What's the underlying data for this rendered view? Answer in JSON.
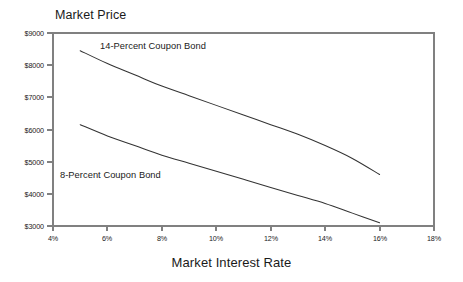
{
  "chart_data": {
    "type": "line",
    "title": "Market Price",
    "xlabel": "Market Interest Rate",
    "ylabel": "Market Price",
    "xlim": [
      4,
      18
    ],
    "ylim": [
      3000,
      9000
    ],
    "grid": false,
    "legend_position": "inline-annotation",
    "x_tick_labels": [
      "4%",
      "6%",
      "8%",
      "10%",
      "12%",
      "14%",
      "16%",
      "18%"
    ],
    "x_tick_values": [
      4,
      6,
      8,
      10,
      12,
      14,
      16,
      18
    ],
    "y_tick_labels": [
      "$9000",
      "$8000",
      "$7000",
      "$6000",
      "$5000",
      "$4000",
      "$3000"
    ],
    "y_tick_values": [
      9000,
      8000,
      7000,
      6000,
      5000,
      4000,
      3000
    ],
    "series": [
      {
        "name": "14-Percent Coupon Bond",
        "x": [
          5,
          6,
          7,
          8,
          9,
          10,
          11,
          12,
          13,
          14,
          15,
          16
        ],
        "values": [
          8450,
          8050,
          7700,
          7350,
          7050,
          6750,
          6450,
          6150,
          5850,
          5500,
          5100,
          4600
        ]
      },
      {
        "name": "8-Percent Coupon Bond",
        "x": [
          5,
          6,
          7,
          8,
          9,
          10,
          11,
          12,
          13,
          14,
          15,
          16
        ],
        "values": [
          6150,
          5800,
          5500,
          5200,
          4950,
          4700,
          4450,
          4200,
          3950,
          3700,
          3400,
          3100
        ]
      }
    ],
    "annotations": [
      {
        "text": "14-Percent Coupon Bond"
      },
      {
        "text": "8-Percent Coupon Bond"
      }
    ],
    "colors": {
      "background": "#ffffff",
      "axis": "#808080",
      "series_line": "#333333",
      "text": "#1a1a1a"
    }
  }
}
